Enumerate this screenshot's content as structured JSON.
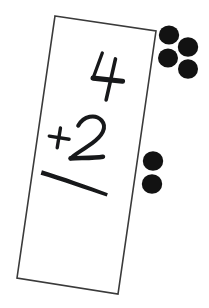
{
  "scene": {
    "description": "Handwritten arithmetic flashcard with counting dots",
    "background_color": "#ffffff",
    "width": 209,
    "height": 308
  },
  "flashcard": {
    "name": "addition-flashcard",
    "fill_color": "#ffffff",
    "border_color": "#3a3a3a",
    "border_width": 1.5,
    "rotation_degrees": 11,
    "corners": [
      [
        55,
        16
      ],
      [
        156,
        31
      ],
      [
        118,
        294
      ],
      [
        17,
        278
      ]
    ]
  },
  "problem": {
    "top_addend": "4",
    "operator": "+",
    "bottom_addend": "2",
    "answer": "",
    "ink_color": "#17181a",
    "statement": "4 + 2"
  },
  "answer_rule": {
    "label": "answer-line",
    "color": "#17181a"
  },
  "counters": {
    "color": "#121212",
    "groups": [
      {
        "name": "dot-group-top",
        "represents": "4",
        "count": 4,
        "dots": [
          {
            "cx": 169,
            "cy": 35,
            "r": 10
          },
          {
            "cx": 188,
            "cy": 47,
            "r": 10
          },
          {
            "cx": 168,
            "cy": 58,
            "r": 10
          },
          {
            "cx": 188,
            "cy": 69,
            "r": 10
          }
        ]
      },
      {
        "name": "dot-group-bottom",
        "represents": "2",
        "count": 2,
        "dots": [
          {
            "cx": 153,
            "cy": 161,
            "r": 10
          },
          {
            "cx": 152,
            "cy": 184,
            "r": 10
          }
        ]
      }
    ]
  }
}
